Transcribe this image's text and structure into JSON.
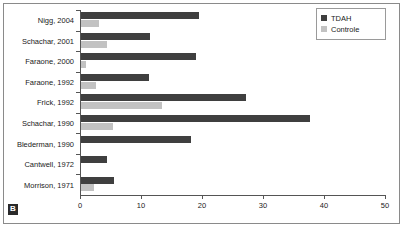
{
  "panel": {
    "letter": "B"
  },
  "legend": {
    "position": "top-right",
    "entries": [
      {
        "label": "TDAH",
        "color": "#3f3f3f"
      },
      {
        "label": "Controle",
        "color": "#c2c2c2"
      }
    ]
  },
  "axis": {
    "x_ticks": [
      "0",
      "10",
      "20",
      "30",
      "40",
      "50"
    ]
  },
  "chart_data": {
    "type": "bar",
    "orientation": "horizontal",
    "title": "",
    "subtitle": "",
    "xlabel": "",
    "ylabel": "",
    "xlim": [
      0,
      50
    ],
    "xticks": [
      0,
      10,
      20,
      30,
      40,
      50
    ],
    "grid": false,
    "legend_position": "top-right",
    "categories": [
      "Nigg, 2004",
      "Schachar, 2001",
      "Faraone, 2000",
      "Faraone, 1992",
      "Frick, 1992",
      "Schachar, 1990",
      "Blederman, 1990",
      "Cantwell, 1972",
      "Morrison, 1971"
    ],
    "series": [
      {
        "name": "TDAH",
        "color": "#3f3f3f",
        "values": [
          19.3,
          11.3,
          18.9,
          11.2,
          27.0,
          37.5,
          18.0,
          4.3,
          5.4
        ]
      },
      {
        "name": "Controle",
        "color": "#c2c2c2",
        "values": [
          3.0,
          4.3,
          0.9,
          2.4,
          13.3,
          5.2,
          0,
          0,
          2.2
        ]
      }
    ]
  }
}
